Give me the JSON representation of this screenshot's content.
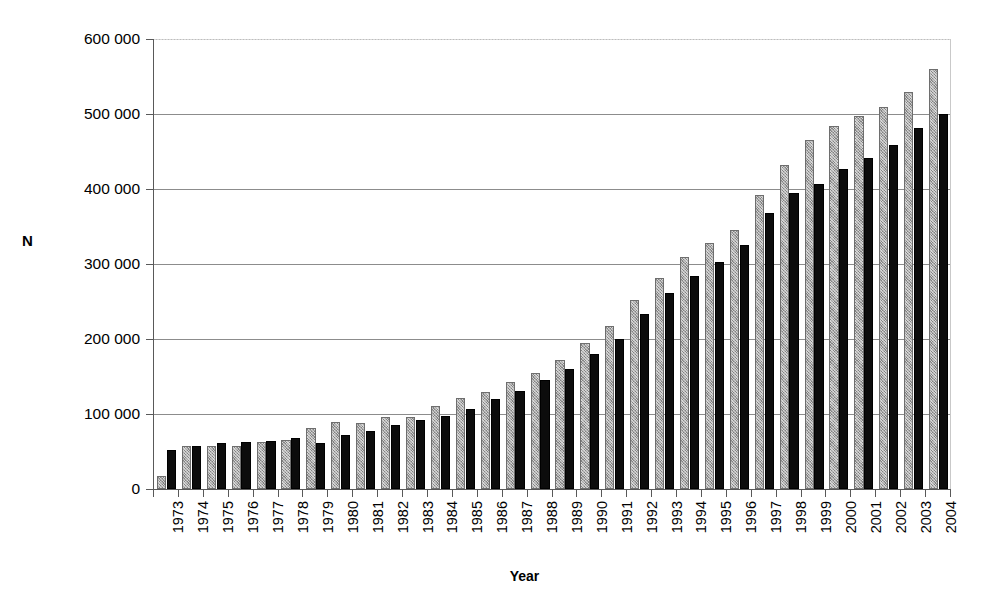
{
  "chart_data": {
    "type": "bar",
    "title": "",
    "xlabel": "Year",
    "ylabel": "N",
    "ylim": [
      0,
      600000
    ],
    "ytick_values": [
      0,
      100000,
      200000,
      300000,
      400000,
      500000,
      600000
    ],
    "ytick_labels": [
      "0",
      "100 000",
      "200 000",
      "300 000",
      "400 000",
      "500 000",
      "600 000"
    ],
    "grid": true,
    "legend": "none",
    "orientation": "vertical",
    "grouping": "grouped",
    "categories": [
      "1973",
      "1974",
      "1975",
      "1976",
      "1977",
      "1978",
      "1979",
      "1980",
      "1981",
      "1982",
      "1983",
      "1984",
      "1985",
      "1986",
      "1987",
      "1988",
      "1989",
      "1990",
      "1991",
      "1992",
      "1993",
      "1994",
      "1995",
      "1996",
      "1997",
      "1998",
      "1999",
      "2000",
      "2001",
      "2002",
      "2003",
      "2004"
    ],
    "series": [
      {
        "name": "series-gray",
        "color": "#a8a8a8",
        "values": [
          18000,
          57000,
          58000,
          58000,
          63000,
          66000,
          81000,
          89000,
          88000,
          96000,
          96000,
          111000,
          122000,
          130000,
          143000,
          155000,
          172000,
          195000,
          217000,
          252000,
          281000,
          310000,
          328000,
          345000,
          392000,
          432000,
          465000,
          484000,
          498000,
          509000,
          530000,
          560000
        ]
      },
      {
        "name": "series-black",
        "color": "#0c0c0c",
        "values": [
          52000,
          58000,
          61000,
          63000,
          64000,
          68000,
          62000,
          72000,
          77000,
          86000,
          92000,
          97000,
          107000,
          120000,
          131000,
          145000,
          160000,
          180000,
          200000,
          234000,
          261000,
          284000,
          303000,
          325000,
          368000,
          395000,
          407000,
          427000,
          442000,
          459000,
          482000,
          500000
        ]
      }
    ]
  },
  "axes": {
    "y_title": "N",
    "x_title": "Year"
  }
}
